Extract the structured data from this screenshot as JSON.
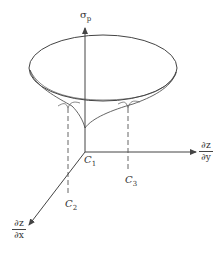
{
  "diagram": {
    "vertical_axis": {
      "symbol": "σ",
      "subscript": "p"
    },
    "horizontal_axis": {
      "numerator": "∂z",
      "denominator": "∂y"
    },
    "diagonal_axis": {
      "numerator": "∂z",
      "denominator": "∂x"
    },
    "points": [
      {
        "symbol": "C",
        "subscript": "1"
      },
      {
        "symbol": "C",
        "subscript": "2"
      },
      {
        "symbol": "C",
        "subscript": "3"
      }
    ],
    "colors": {
      "stroke": "#444444",
      "background": "#ffffff"
    }
  }
}
